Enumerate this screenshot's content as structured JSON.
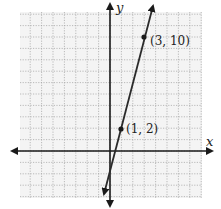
{
  "chart_data": {
    "type": "line",
    "title": "",
    "xlabel": "x",
    "ylabel": "y",
    "grid": true,
    "xlim": [
      -8,
      8
    ],
    "ylim": [
      -4,
      12
    ],
    "series": [
      {
        "name": "line",
        "x": [
          1,
          3
        ],
        "y": [
          2,
          10
        ],
        "slope": 4,
        "intercept": -2
      }
    ],
    "points": [
      {
        "x": 1,
        "y": 2,
        "label": "(1, 2)"
      },
      {
        "x": 3,
        "y": 10,
        "label": "(3, 10)"
      }
    ]
  },
  "labels": {
    "x_axis": "x",
    "y_axis": "y",
    "p1": "(1, 2)",
    "p2": "(3, 10)"
  },
  "colors": {
    "grid": "#9a9a9a",
    "axis": "#1a1a1a",
    "line": "#2a2a2a",
    "bg": "#f4f4f4"
  }
}
